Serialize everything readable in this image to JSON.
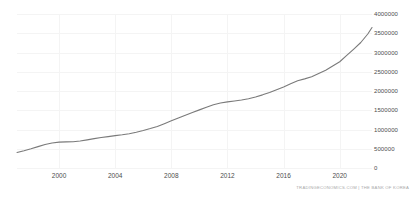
{
  "attribution": "TRADINGECONOMICS.COM | THE BANK OF KOREA",
  "colors": {
    "line": "#7a7a7a",
    "grid": "#f4f4f4",
    "tick_text": "#4d4d4d",
    "attribution_text": "#a8a8a8",
    "background": "#ffffff"
  },
  "chart_data": {
    "type": "line",
    "title": "",
    "subtitle": "",
    "xlabel": "",
    "ylabel": "",
    "xlim": [
      1997.0,
      2022.3
    ],
    "ylim": [
      0,
      4000000
    ],
    "grid": true,
    "legend": "none",
    "y_ticks": [
      0,
      500000,
      1000000,
      1500000,
      2000000,
      2500000,
      3000000,
      3500000,
      4000000
    ],
    "y_tick_labels": [
      "0",
      "500000",
      "1000000",
      "1500000",
      "2000000",
      "2500000",
      "3000000",
      "3500000",
      "4000000"
    ],
    "x_ticks": [
      2000,
      2004,
      2008,
      2012,
      2016,
      2020
    ],
    "x_tick_labels": [
      "2000",
      "2004",
      "2008",
      "2012",
      "2016",
      "2020"
    ],
    "series": [
      {
        "name": "Money Supply M2",
        "color": "#7a7a7a",
        "x": [
          1997.0,
          1997.5,
          1998.0,
          1998.5,
          1999.0,
          1999.5,
          2000.0,
          2000.5,
          2001.0,
          2001.5,
          2002.0,
          2002.5,
          2003.0,
          2003.5,
          2004.0,
          2004.5,
          2005.0,
          2005.5,
          2006.0,
          2006.5,
          2007.0,
          2007.5,
          2008.0,
          2008.5,
          2009.0,
          2009.5,
          2010.0,
          2010.5,
          2011.0,
          2011.5,
          2012.0,
          2012.5,
          2013.0,
          2013.5,
          2014.0,
          2014.5,
          2015.0,
          2015.5,
          2016.0,
          2016.5,
          2017.0,
          2017.5,
          2018.0,
          2018.5,
          2019.0,
          2019.5,
          2020.0,
          2020.5,
          2021.0,
          2021.5,
          2022.0,
          2022.3
        ],
        "y": [
          405000,
          450000,
          500000,
          555000,
          610000,
          648000,
          672000,
          678000,
          680000,
          700000,
          730000,
          762000,
          790000,
          815000,
          840000,
          862000,
          890000,
          930000,
          975000,
          1025000,
          1080000,
          1150000,
          1225000,
          1300000,
          1370000,
          1440000,
          1510000,
          1580000,
          1645000,
          1690000,
          1718000,
          1742000,
          1768000,
          1800000,
          1845000,
          1900000,
          1960000,
          2035000,
          2105000,
          2190000,
          2265000,
          2315000,
          2370000,
          2455000,
          2540000,
          2650000,
          2760000,
          2925000,
          3090000,
          3260000,
          3480000,
          3650000
        ]
      }
    ]
  }
}
